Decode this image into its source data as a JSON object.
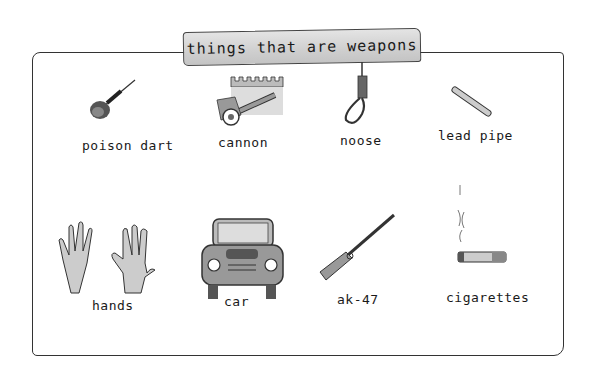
{
  "title": "things that are weapons",
  "items": [
    {
      "label": "poison dart",
      "icon": "poison-dart-icon"
    },
    {
      "label": "cannon",
      "icon": "cannon-icon"
    },
    {
      "label": "noose",
      "icon": "noose-icon"
    },
    {
      "label": "lead pipe",
      "icon": "lead-pipe-icon"
    },
    {
      "label": "hands",
      "icon": "hands-icon"
    },
    {
      "label": "car",
      "icon": "car-icon"
    },
    {
      "label": "ak-47",
      "icon": "rifle-icon"
    },
    {
      "label": "cigarettes",
      "icon": "cigarette-icon"
    }
  ]
}
